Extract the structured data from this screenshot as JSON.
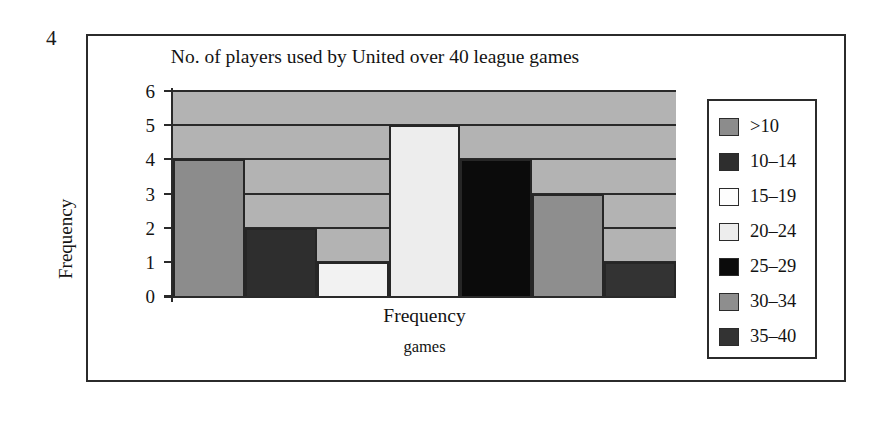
{
  "figure": {
    "number": "4"
  },
  "chart_data": {
    "type": "bar",
    "title": "No. of players used by United over 40 league games",
    "xlabel": "Frequency",
    "xlabel_sub": "games",
    "ylabel": "Frequency",
    "categories": [
      ">10",
      "10–14",
      "15–19",
      "20–24",
      "25–29",
      "30–34",
      "35–40"
    ],
    "values": [
      4,
      2,
      1,
      5,
      4,
      3,
      1
    ],
    "ylim": [
      0,
      6
    ],
    "yticks": [
      "0",
      "1",
      "2",
      "3",
      "4",
      "5",
      "6"
    ],
    "grid": true,
    "legend_position": "right",
    "plot_background": "#b3b3b3",
    "series_colors": [
      "#8c8c8c",
      "#2e2e2e",
      "#f2f2f2",
      "#ededed",
      "#0b0b0b",
      "#8e8e8e",
      "#333333"
    ]
  },
  "legend": {
    "items": [
      {
        "label": ">10",
        "color": "#8c8c8c"
      },
      {
        "label": "10–14",
        "color": "#2e2e2e"
      },
      {
        "label": "15–19",
        "color": "#fdfdfd"
      },
      {
        "label": "20–24",
        "color": "#ededed"
      },
      {
        "label": "25–29",
        "color": "#0b0b0b"
      },
      {
        "label": "30–34",
        "color": "#8e8e8e"
      },
      {
        "label": "35–40",
        "color": "#333333"
      }
    ]
  }
}
